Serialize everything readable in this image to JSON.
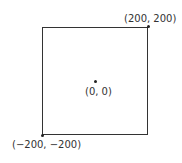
{
  "diagram": {
    "points": [
      {
        "id": "top-right",
        "label": "(200, 200)"
      },
      {
        "id": "center",
        "label": "(0, 0)"
      },
      {
        "id": "bottom-left",
        "label": "(−200, −200)"
      }
    ]
  }
}
